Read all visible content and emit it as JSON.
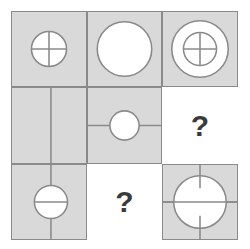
{
  "puzzle": {
    "type": "matrix-reasoning",
    "rows": 3,
    "cols": 3,
    "missing_label": "?",
    "colors": {
      "cell_fill": "#d9d9d9",
      "cell_stroke": "#8a8a8a",
      "shape_stroke": "#8a8a8a",
      "shape_fill": "#ffffff",
      "background": "#ffffff",
      "question_mark": "#3a3a3a"
    },
    "cells": [
      {
        "id": "cell-r1c1",
        "row": 1,
        "col": 1,
        "filled": true,
        "label": "small circle with full crosshair",
        "question": false
      },
      {
        "id": "cell-r1c2",
        "row": 1,
        "col": 2,
        "filled": true,
        "label": "large plain circle",
        "question": false
      },
      {
        "id": "cell-r1c3",
        "row": 1,
        "col": 3,
        "filled": true,
        "label": "large circle containing small circle with crosshair",
        "question": false
      },
      {
        "id": "cell-r2c1",
        "row": 2,
        "col": 1,
        "filled": true,
        "label": "vertical line only",
        "question": false
      },
      {
        "id": "cell-r2c2",
        "row": 2,
        "col": 2,
        "filled": true,
        "label": "small circle with horizontal line through cell",
        "question": false
      },
      {
        "id": "cell-r2c3",
        "row": 2,
        "col": 3,
        "filled": false,
        "label": "missing tile",
        "question": true
      },
      {
        "id": "cell-r3c1",
        "row": 3,
        "col": 1,
        "filled": true,
        "label": "vertical line through cell with circle bisected horizontally",
        "question": false
      },
      {
        "id": "cell-r3c2",
        "row": 3,
        "col": 2,
        "filled": false,
        "label": "missing tile",
        "question": true
      },
      {
        "id": "cell-r3c3",
        "row": 3,
        "col": 3,
        "filled": true,
        "label": "large circle with full horizontal line and partial vertical ticks",
        "question": false
      }
    ]
  }
}
